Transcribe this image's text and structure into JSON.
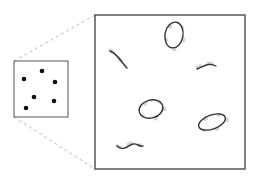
{
  "diagram": {
    "colors": {
      "outline": "#555555",
      "dash": "#bbbbbb",
      "stroke": "#333333",
      "shadow": "#c8c8c8",
      "dot": "#111111"
    },
    "small_panel": {
      "x": 14,
      "y": 61,
      "w": 54,
      "h": 56
    },
    "large_panel": {
      "x": 95,
      "y": 15,
      "w": 150,
      "h": 154
    },
    "dots": [
      {
        "cx": 42,
        "cy": 71
      },
      {
        "cx": 24,
        "cy": 79
      },
      {
        "cx": 55,
        "cy": 82
      },
      {
        "cx": 34,
        "cy": 97
      },
      {
        "cx": 54,
        "cy": 101
      },
      {
        "cx": 26,
        "cy": 108
      }
    ],
    "shapes": [
      {
        "type": "loop",
        "cx": 174,
        "cy": 35,
        "rx": 9,
        "ry": 13,
        "rot": 10
      },
      {
        "type": "curve",
        "d": "M110 51 C118 54 121 62 127 68"
      },
      {
        "type": "curve",
        "d": "M197 69 C204 66 209 62 216 66"
      },
      {
        "type": "loop",
        "cx": 151,
        "cy": 109,
        "rx": 12,
        "ry": 9,
        "rot": -15
      },
      {
        "type": "loop",
        "cx": 212,
        "cy": 122,
        "rx": 14,
        "ry": 7,
        "rot": -20
      },
      {
        "type": "curve",
        "d": "M117 146 C124 152 128 145 133 144 C137 143 139 147 143 146"
      }
    ]
  }
}
